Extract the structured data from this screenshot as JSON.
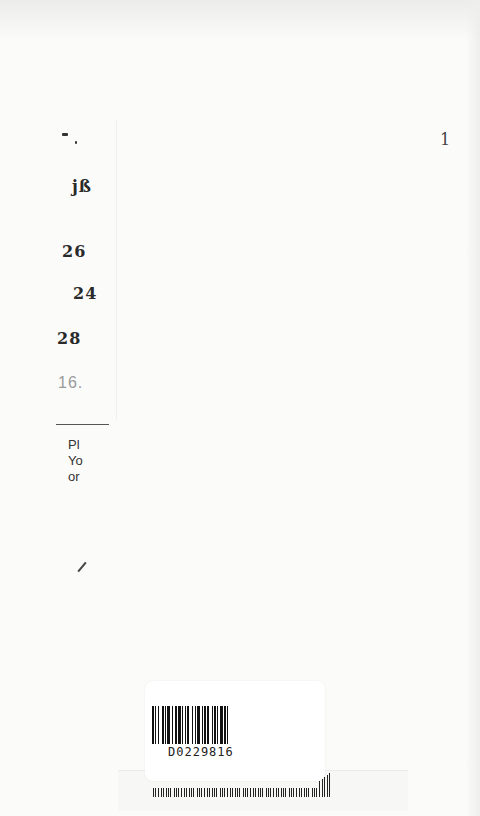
{
  "document": {
    "type": "library-due-date-slip",
    "stamped_dates": [
      {
        "text": "jß",
        "partial": true
      },
      {
        "text": "26",
        "partial": true
      },
      {
        "text": "24",
        "partial": true
      },
      {
        "text": "28",
        "partial": true
      },
      {
        "text": "16.",
        "partial": true,
        "faded": true
      }
    ],
    "top_left_mark": "‒ ʼ",
    "top_right_mark": "1",
    "notice_lines": [
      "Pl",
      "Yo",
      "or"
    ],
    "barcode": {
      "value": "D0229816"
    }
  }
}
